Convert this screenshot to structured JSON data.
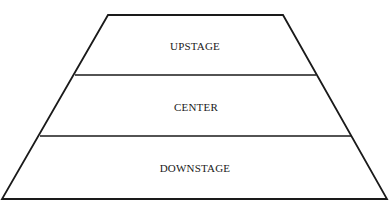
{
  "diagram": {
    "type": "stage-areas-trapezoid",
    "sections": [
      {
        "label": "UPSTAGE"
      },
      {
        "label": "CENTER"
      },
      {
        "label": "DOWNSTAGE"
      }
    ],
    "colors": {
      "stroke": "#1a1a1a",
      "background": "#ffffff"
    }
  }
}
